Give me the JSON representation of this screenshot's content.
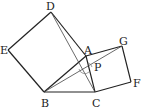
{
  "figure": {
    "type": "geometry-diagram",
    "points": {
      "A": "A",
      "B": "B",
      "C": "C",
      "D": "D",
      "E": "E",
      "F": "F",
      "G": "G",
      "P": "P"
    },
    "line_color": "#222222"
  }
}
